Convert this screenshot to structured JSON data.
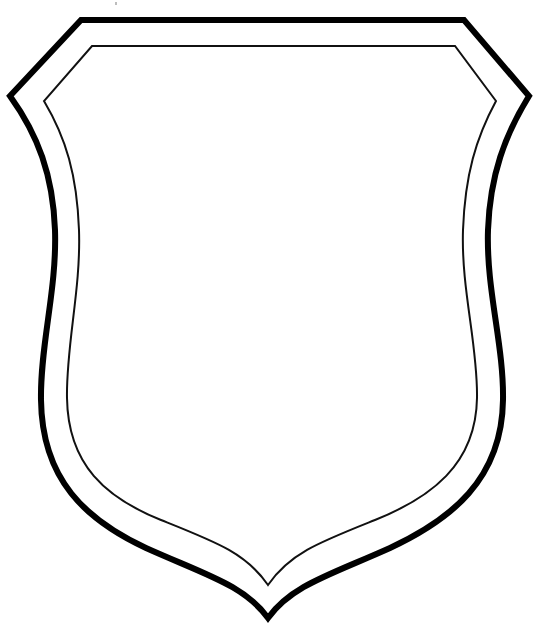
{
  "figure": {
    "colors": {
      "background": "#ffffff",
      "outer_stroke": "#000000",
      "inner_stroke": "#111111"
    },
    "stroke_widths": {
      "outer": 6,
      "inner": 2
    }
  }
}
